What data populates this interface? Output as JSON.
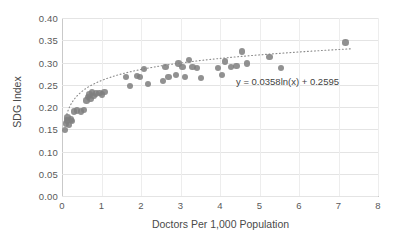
{
  "chart_data": {
    "type": "scatter",
    "title": "",
    "xlabel": "Doctors Per 1,000 Population",
    "ylabel": "SDG Index",
    "xlim": [
      0,
      8
    ],
    "ylim": [
      0.0,
      0.4
    ],
    "xticks": [
      "0",
      "1",
      "2",
      "3",
      "4",
      "5",
      "6",
      "7",
      "8"
    ],
    "xtick_values": [
      0,
      1,
      2,
      3,
      4,
      5,
      6,
      7,
      8
    ],
    "yticks": [
      "0.00",
      "0.05",
      "0.10",
      "0.15",
      "0.20",
      "0.25",
      "0.30",
      "0.35",
      "0.40"
    ],
    "ytick_values": [
      0.0,
      0.05,
      0.1,
      0.15,
      0.2,
      0.25,
      0.3,
      0.35,
      0.4
    ],
    "grid": "horizontal-and-vertical",
    "legend": "none",
    "point_color": "#7f7f7f",
    "gridline_color": "#e4e4e4",
    "axis_color": "#c9c9c9",
    "annotation": "y = 0.0358ln(x) + 0.2595",
    "trendline": {
      "type": "logarithmic",
      "style": "dotted",
      "color": "#8c8c8c",
      "a": 0.0358,
      "b": 0.2595,
      "x_start": 0.12,
      "x_end": 7.35
    },
    "points": [
      {
        "x": 0.08,
        "y": 0.148
      },
      {
        "x": 0.1,
        "y": 0.163
      },
      {
        "x": 0.12,
        "y": 0.17
      },
      {
        "x": 0.14,
        "y": 0.176
      },
      {
        "x": 0.18,
        "y": 0.16
      },
      {
        "x": 0.22,
        "y": 0.172
      },
      {
        "x": 0.26,
        "y": 0.168
      },
      {
        "x": 0.3,
        "y": 0.19
      },
      {
        "x": 0.38,
        "y": 0.192
      },
      {
        "x": 0.48,
        "y": 0.19
      },
      {
        "x": 0.55,
        "y": 0.193
      },
      {
        "x": 0.62,
        "y": 0.215
      },
      {
        "x": 0.66,
        "y": 0.222
      },
      {
        "x": 0.7,
        "y": 0.228
      },
      {
        "x": 0.72,
        "y": 0.218
      },
      {
        "x": 0.76,
        "y": 0.233
      },
      {
        "x": 0.8,
        "y": 0.225
      },
      {
        "x": 0.86,
        "y": 0.23
      },
      {
        "x": 0.95,
        "y": 0.232
      },
      {
        "x": 1.02,
        "y": 0.228
      },
      {
        "x": 1.08,
        "y": 0.234
      },
      {
        "x": 1.62,
        "y": 0.268
      },
      {
        "x": 1.72,
        "y": 0.247
      },
      {
        "x": 1.9,
        "y": 0.27
      },
      {
        "x": 1.98,
        "y": 0.268
      },
      {
        "x": 2.08,
        "y": 0.285
      },
      {
        "x": 2.18,
        "y": 0.252
      },
      {
        "x": 2.55,
        "y": 0.258
      },
      {
        "x": 2.62,
        "y": 0.29
      },
      {
        "x": 2.7,
        "y": 0.268
      },
      {
        "x": 2.88,
        "y": 0.272
      },
      {
        "x": 2.95,
        "y": 0.298
      },
      {
        "x": 3.05,
        "y": 0.29
      },
      {
        "x": 3.12,
        "y": 0.268
      },
      {
        "x": 3.22,
        "y": 0.305
      },
      {
        "x": 3.3,
        "y": 0.29
      },
      {
        "x": 3.42,
        "y": 0.288
      },
      {
        "x": 3.52,
        "y": 0.265
      },
      {
        "x": 3.95,
        "y": 0.288
      },
      {
        "x": 4.05,
        "y": 0.272
      },
      {
        "x": 4.12,
        "y": 0.302
      },
      {
        "x": 4.28,
        "y": 0.29
      },
      {
        "x": 4.42,
        "y": 0.292
      },
      {
        "x": 4.55,
        "y": 0.325
      },
      {
        "x": 4.68,
        "y": 0.298
      },
      {
        "x": 5.25,
        "y": 0.312
      },
      {
        "x": 5.55,
        "y": 0.288
      },
      {
        "x": 7.18,
        "y": 0.345
      }
    ]
  }
}
